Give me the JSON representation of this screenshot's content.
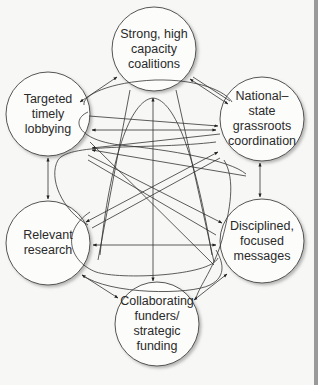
{
  "diagram": {
    "nodes": [
      {
        "id": "coalitions",
        "lines": [
          "Strong, high",
          "capacity",
          "coalitions"
        ],
        "cx": 154,
        "cy": 49
      },
      {
        "id": "lobbying",
        "lines": [
          "Targeted",
          "timely",
          "lobbying"
        ],
        "cx": 48,
        "cy": 114
      },
      {
        "id": "grassroots",
        "lines": [
          "National–",
          "state",
          "grassroots",
          "coordination"
        ],
        "cx": 262,
        "cy": 119
      },
      {
        "id": "research",
        "lines": [
          "Relevant",
          "research"
        ],
        "cx": 48,
        "cy": 243
      },
      {
        "id": "messages",
        "lines": [
          "Disciplined,",
          "focused",
          "messages"
        ],
        "cx": 262,
        "cy": 241
      },
      {
        "id": "funding",
        "lines": [
          "Collaborating",
          "funders/",
          "strategic",
          "funding"
        ],
        "cx": 157,
        "cy": 324
      }
    ],
    "colors": {
      "background": "#f7f7f5",
      "circle_fill": "#fcfcfb",
      "stroke": "#333333",
      "text": "#2a2a2a",
      "edge_bar": "#9a9a9a"
    }
  }
}
